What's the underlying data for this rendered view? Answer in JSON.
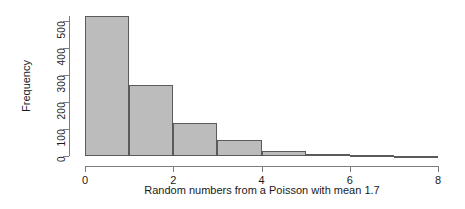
{
  "chart_data": {
    "type": "bar",
    "subtype": "histogram",
    "title": "",
    "xlabel": "Random numbers from a Poisson with mean 1.7",
    "ylabel": "Frequency",
    "xlim": [
      0,
      8
    ],
    "ylim": [
      0,
      520
    ],
    "grid": false,
    "legend": null,
    "bin_width": 1,
    "bin_edges": [
      0,
      1,
      2,
      3,
      4,
      5,
      6,
      7,
      8
    ],
    "categories": [
      "0-1",
      "1-2",
      "2-3",
      "3-4",
      "4-5",
      "5-6",
      "6-7",
      "7-8"
    ],
    "values": [
      520,
      263,
      122,
      58,
      17,
      7,
      2,
      1
    ],
    "xticks": [
      0,
      2,
      4,
      6,
      8
    ],
    "xtick_labels": [
      "0",
      "2",
      "4",
      "6",
      "8"
    ],
    "yticks": [
      0,
      100,
      200,
      300,
      400,
      500
    ],
    "ytick_labels": [
      "0",
      "100",
      "200",
      "300",
      "400",
      "500"
    ],
    "bar_fill_color": "#bcbcbc",
    "bar_border_color": "#5a5a5a",
    "axis_color": "#7d7d7d",
    "text_color": "#1a1a1a",
    "background_color": "#ffffff"
  }
}
